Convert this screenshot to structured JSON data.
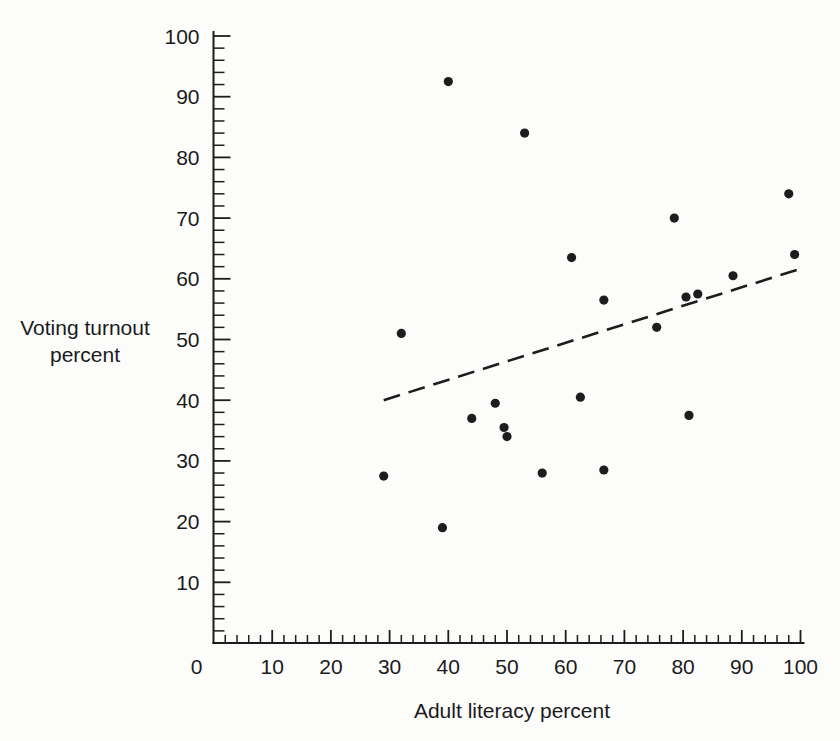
{
  "chart_data": {
    "type": "scatter",
    "title": "",
    "xlabel": "Adult literacy percent",
    "ylabel": "Voting turnout percent",
    "ylabel_lines": [
      "Voting turnout",
      "percent"
    ],
    "xlim": [
      0,
      100
    ],
    "ylim": [
      0,
      100
    ],
    "x_major_ticks": [
      0,
      10,
      20,
      30,
      40,
      50,
      60,
      70,
      80,
      90,
      100
    ],
    "y_major_ticks": [
      10,
      20,
      30,
      40,
      50,
      60,
      70,
      80,
      90,
      100
    ],
    "minor_tick_step": 2,
    "grid": "off",
    "legend": "none",
    "points": [
      [
        40,
        92.5
      ],
      [
        53,
        84
      ],
      [
        98,
        74
      ],
      [
        78.5,
        70
      ],
      [
        99,
        64
      ],
      [
        61,
        63.5
      ],
      [
        88.5,
        60.5
      ],
      [
        82.5,
        57.5
      ],
      [
        80.5,
        57
      ],
      [
        66.5,
        56.5
      ],
      [
        75.5,
        52
      ],
      [
        32,
        51
      ],
      [
        62.5,
        40.5
      ],
      [
        48,
        39.5
      ],
      [
        81,
        37.5
      ],
      [
        44,
        37
      ],
      [
        49.5,
        35.5
      ],
      [
        50,
        34
      ],
      [
        66.5,
        28.5
      ],
      [
        56,
        28
      ],
      [
        29,
        27.5
      ],
      [
        39,
        19
      ]
    ],
    "trendline": {
      "style": "dashed",
      "x1": 29,
      "y1": 40,
      "x2": 99.5,
      "y2": 61.5
    },
    "ink_color": "#1d1d1d",
    "background_color": "#fcfcfb"
  }
}
